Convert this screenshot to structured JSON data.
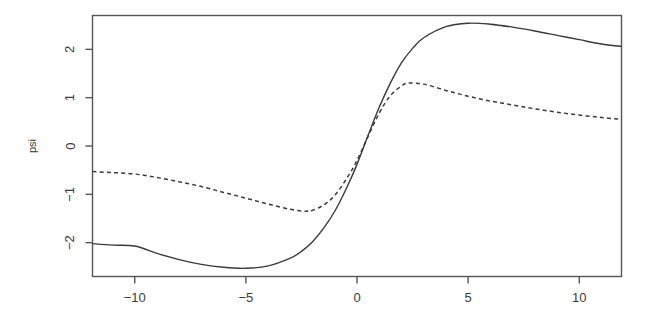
{
  "figure": {
    "width": 652,
    "height": 327,
    "background": "#ffffff",
    "frame_color": "#555555",
    "curve_color": "#3a3a3a"
  },
  "chart_data": {
    "type": "line",
    "title": "",
    "subtitle": "",
    "xlabel": "",
    "ylabel": "psi",
    "xlim": [
      -11.9,
      11.9
    ],
    "ylim": [
      -2.7,
      2.7
    ],
    "grid": false,
    "legend": "none",
    "xticks": [
      -10,
      -5,
      0,
      5,
      10
    ],
    "xtick_labels": [
      "-10",
      "-5",
      "0",
      "5",
      "10"
    ],
    "yticks": [
      -2,
      -1,
      0,
      1,
      2
    ],
    "ytick_labels": [
      "-2",
      "-1",
      "0",
      "1",
      "2"
    ],
    "series": [
      {
        "name": "solid-curve",
        "linestyle": "solid",
        "color": "#3a3a3a",
        "x": [
          -11.9,
          -11.0,
          -10.0,
          -9.0,
          -8.0,
          -7.0,
          -6.0,
          -5.0,
          -4.0,
          -3.0,
          -2.5,
          -2.0,
          -1.5,
          -1.0,
          -0.5,
          0.0,
          0.5,
          1.0,
          1.5,
          2.0,
          2.5,
          3.0,
          4.0,
          5.0,
          6.0,
          7.0,
          8.0,
          9.0,
          10.0,
          11.0,
          11.9
        ],
        "y": [
          -2.02,
          -2.05,
          -2.07,
          -2.22,
          -2.35,
          -2.45,
          -2.51,
          -2.53,
          -2.48,
          -2.32,
          -2.18,
          -1.98,
          -1.7,
          -1.35,
          -0.9,
          -0.38,
          0.22,
          0.8,
          1.3,
          1.72,
          2.02,
          2.24,
          2.47,
          2.54,
          2.52,
          2.46,
          2.38,
          2.29,
          2.2,
          2.11,
          2.06
        ]
      },
      {
        "name": "dashed-curve",
        "linestyle": "dashed",
        "color": "#3a3a3a",
        "x": [
          -11.9,
          -11.0,
          -10.0,
          -9.0,
          -8.0,
          -7.0,
          -6.0,
          -5.0,
          -4.0,
          -3.0,
          -2.3,
          -2.0,
          -1.5,
          -1.0,
          -0.5,
          0.0,
          0.5,
          1.0,
          1.5,
          2.0,
          2.3,
          3.0,
          4.0,
          5.0,
          6.0,
          7.0,
          8.0,
          9.0,
          10.0,
          11.0,
          11.9
        ],
        "y": [
          -0.53,
          -0.55,
          -0.58,
          -0.65,
          -0.74,
          -0.84,
          -0.96,
          -1.08,
          -1.2,
          -1.31,
          -1.35,
          -1.33,
          -1.22,
          -1.02,
          -0.7,
          -0.3,
          0.2,
          0.68,
          1.04,
          1.24,
          1.3,
          1.28,
          1.15,
          1.03,
          0.93,
          0.85,
          0.77,
          0.7,
          0.64,
          0.59,
          0.55
        ]
      }
    ]
  },
  "axes": {
    "y_axis_title": "psi",
    "x_axis_title": ""
  }
}
